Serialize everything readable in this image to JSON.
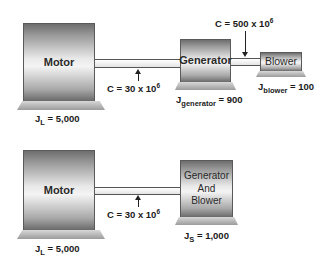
{
  "top_system": {
    "motor": {
      "label": "Motor",
      "inertia_symbol": "J",
      "inertia_sub": "L",
      "inertia_value": "= 5,000"
    },
    "shaft1": {
      "stiffness_prefix": "C = 30 x 10",
      "stiffness_exp": "6"
    },
    "generator": {
      "label": "Generator",
      "inertia_symbol": "J",
      "inertia_sub": "generator",
      "inertia_value": "= 900"
    },
    "shaft2": {
      "stiffness_prefix": "C = 500 x 10",
      "stiffness_exp": "6"
    },
    "blower": {
      "label": "Blower",
      "inertia_symbol": "J",
      "inertia_sub": "blower",
      "inertia_value": "= 100"
    }
  },
  "bottom_system": {
    "motor": {
      "label": "Motor",
      "inertia_symbol": "J",
      "inertia_sub": "L",
      "inertia_value": "= 5,000"
    },
    "shaft1": {
      "stiffness_prefix": "C = 30 x 10",
      "stiffness_exp": "6"
    },
    "combined": {
      "label_line1": "Generator",
      "label_line2": "And",
      "label_line3": "Blower",
      "inertia_symbol": "J",
      "inertia_sub": "S",
      "inertia_value": "= 1,000"
    }
  },
  "colors": {
    "machine_dark": "#6e6e6e",
    "machine_light": "#f4f4f4",
    "text": "#1a1a1a"
  }
}
